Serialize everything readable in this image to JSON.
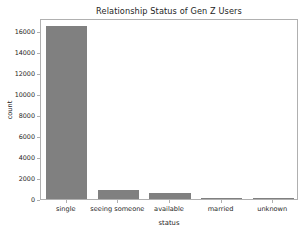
{
  "chart_data": {
    "type": "bar",
    "title": "Relationship Status of Gen Z Users",
    "xlabel": "status",
    "ylabel": "count",
    "categories": [
      "single",
      "seeing someone",
      "available",
      "married",
      "unknown"
    ],
    "values": [
      16500,
      850,
      600,
      60,
      40
    ],
    "yticks": [
      0,
      2000,
      4000,
      6000,
      8000,
      10000,
      12000,
      14000,
      16000
    ],
    "ytick_labels": [
      "0",
      "2000",
      "4000",
      "6000",
      "8000",
      "10000",
      "12000",
      "14000",
      "16000"
    ],
    "ylim": [
      0,
      17250
    ],
    "xlim": [
      -0.5,
      4.5
    ],
    "grid": false,
    "legend": null,
    "bar_color": "#808080",
    "axes_color": "#b0b0b0",
    "text_color": "#262626",
    "background_color": "#ffffff"
  }
}
